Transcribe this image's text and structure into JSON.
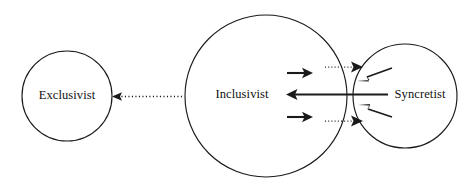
{
  "diagram": {
    "background_color": "#ffffff",
    "stroke_color": "#1a1a1a",
    "nodes": [
      {
        "id": "exclusivist",
        "label": "Exclusivist",
        "shape": "circle",
        "cx": 67,
        "cy": 96,
        "r": 45
      },
      {
        "id": "inclusivist",
        "label": "Inclusivist",
        "shape": "circle",
        "cx": 266,
        "cy": 96,
        "r": 81
      },
      {
        "id": "syncretist",
        "label": "Syncretist",
        "shape": "circle",
        "cx": 405,
        "cy": 96,
        "r": 52
      }
    ],
    "connectors": [
      {
        "id": "inclusivist-to-exclusivist",
        "style": "dotted",
        "direction": "left",
        "from": "inclusivist",
        "to": "exclusivist"
      },
      {
        "id": "inclusivist-out-upper",
        "style": "solid",
        "direction": "right",
        "from": "inclusivist",
        "to": "syncretist"
      },
      {
        "id": "inclusivist-out-lower",
        "style": "solid",
        "direction": "right",
        "from": "inclusivist",
        "to": "syncretist"
      },
      {
        "id": "syncretist-to-inclusivist",
        "style": "solid",
        "direction": "left",
        "from": "syncretist",
        "to": "inclusivist"
      },
      {
        "id": "junction-dotted-upper",
        "style": "dotted",
        "direction": "right",
        "from": "inclusivist",
        "to": "syncretist"
      },
      {
        "id": "junction-dotted-lower",
        "style": "dotted",
        "direction": "right",
        "from": "inclusivist",
        "to": "syncretist"
      },
      {
        "id": "syncretist-diagonal-upper",
        "style": "solid",
        "direction": "down-left",
        "from": "syncretist",
        "to": "junction"
      },
      {
        "id": "syncretist-diagonal-lower",
        "style": "solid",
        "direction": "up-left",
        "from": "syncretist",
        "to": "junction"
      }
    ]
  }
}
